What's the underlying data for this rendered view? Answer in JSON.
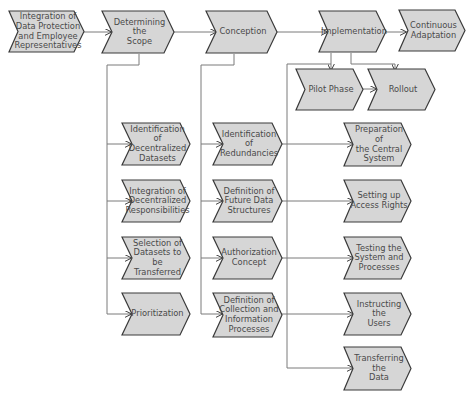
{
  "colors": {
    "node_fill": "#d6d6d6",
    "node_stroke": "#3a3a3a",
    "connector": "#7a7a7a",
    "text": "#4a4a4a"
  },
  "main_process": [
    {
      "id": "integration",
      "label": "Integration of\nData Protection\nand Employee\nRepresentatives"
    },
    {
      "id": "scope",
      "label": "Determining\nthe\nScope"
    },
    {
      "id": "conception",
      "label": "Conception"
    },
    {
      "id": "implementation",
      "label": "Implementation"
    },
    {
      "id": "adaptation",
      "label": "Continuous\nAdaptation"
    }
  ],
  "implementation_phases": [
    {
      "id": "pilot",
      "label": "Pilot Phase"
    },
    {
      "id": "rollout",
      "label": "Rollout"
    }
  ],
  "scope_steps": [
    {
      "label": "Identification of\nDecentralized\nDatasets"
    },
    {
      "label": "Integration of\nDecentralized\nResponsibilities"
    },
    {
      "label": "Selection of\nDatasets to be\nTransferred"
    },
    {
      "label": "Prioritization"
    }
  ],
  "conception_steps": [
    {
      "label": "Identification\nof\nRedundancies"
    },
    {
      "label": "Definition of\nFuture Data\nStructures"
    },
    {
      "label": "Authorization\nConcept"
    },
    {
      "label": "Definition of\nCollection and\nInformation\nProcesses"
    }
  ],
  "implementation_steps": [
    {
      "label": "Preparation of\nthe Central\nSystem"
    },
    {
      "label": "Setting up\nAccess Rights"
    },
    {
      "label": "Testing the\nSystem and\nProcesses"
    },
    {
      "label": "Instructing\nthe\nUsers"
    },
    {
      "label": "Transferring\nthe\nData"
    }
  ]
}
